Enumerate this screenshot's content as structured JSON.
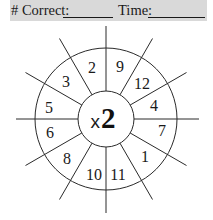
{
  "header": {
    "correct_label": "# Correct:",
    "time_label": "Time:",
    "background": "#d9d9d9"
  },
  "wheel": {
    "operator": "x",
    "multiplier": "2",
    "sector_numbers": {
      "s0": "4",
      "s1": "12",
      "s2": "9",
      "s3": "2",
      "s4": "3",
      "s5": "5",
      "s6": "6",
      "s7": "8",
      "s8": "10",
      "s9": "11",
      "s10": "1",
      "s11": "7"
    },
    "reading_order_clockwise_from_top": [
      "9",
      "12",
      "4",
      "7",
      "1",
      "11",
      "10",
      "8",
      "6",
      "5",
      "3",
      "2"
    ]
  }
}
